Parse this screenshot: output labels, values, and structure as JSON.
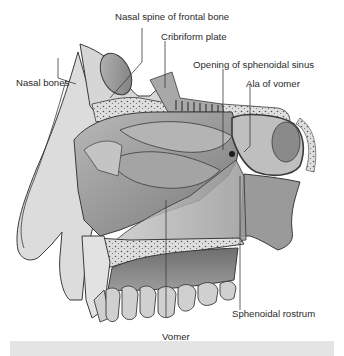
{
  "figure": {
    "style": "grayscale anatomical illustration",
    "colors": {
      "background": "#ffffff",
      "bone_fill": "#d9d9d9",
      "bone_dark": "#8c8c8c",
      "soft_tissue": "#a6a6a6",
      "outline": "#3a3a3a",
      "leader_line": "#3a3a3a",
      "caption_bar": "#e4e4e4"
    }
  },
  "labels": [
    {
      "id": "nasal-spine-frontal-bone",
      "text": "Nasal spine of frontal bone"
    },
    {
      "id": "cribriform-plate",
      "text": "Cribriform plate"
    },
    {
      "id": "opening-sphenoidal-sinus",
      "text": "Opening of sphenoidal sinus"
    },
    {
      "id": "nasal-bones",
      "text": "Nasal bones"
    },
    {
      "id": "ala-of-vomer",
      "text": "Ala of vomer"
    },
    {
      "id": "sphenoidal-rostrum",
      "text": "Sphenoidal rostrum"
    },
    {
      "id": "vomer",
      "text": "Vomer"
    }
  ]
}
